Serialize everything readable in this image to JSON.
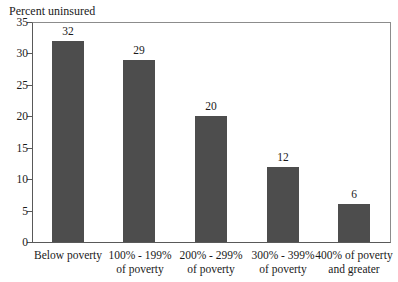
{
  "colors": {
    "bar_fill": "#4d4d4d",
    "axis_line": "#595959",
    "border_line": "#8c8c8c",
    "text": "#1a1a1a"
  },
  "chart_data": {
    "type": "bar",
    "title": "",
    "ylabel": "Percent uninsured",
    "xlabel": "",
    "categories": [
      "Below poverty",
      "100% - 199%\nof poverty",
      "200% - 299%\nof poverty",
      "300% - 399%\nof poverty",
      "400% of poverty\nand greater"
    ],
    "values": [
      32,
      29,
      20,
      12,
      6
    ],
    "data_labels": [
      "32",
      "29",
      "20",
      "12",
      "6"
    ],
    "yticks": [
      0,
      5,
      10,
      15,
      20,
      25,
      30,
      35
    ],
    "ylim": [
      0,
      35
    ],
    "grid": false,
    "legend": false,
    "bar_color": "#4d4d4d"
  }
}
